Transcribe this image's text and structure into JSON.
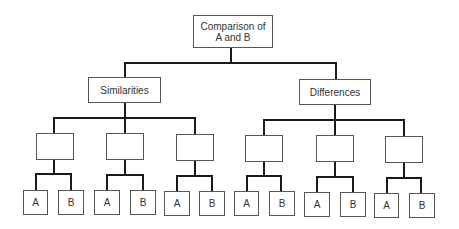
{
  "diagram": {
    "type": "tree",
    "line_color": "#1a1a1a",
    "box_border_color": "#555555",
    "root": {
      "label_line1": "Comparison of",
      "label_line2": "A and B"
    },
    "branches": [
      {
        "label": "Similarities",
        "children": [
          {
            "label": "",
            "leaves": [
              "A",
              "B"
            ]
          },
          {
            "label": "",
            "leaves": [
              "A",
              "B"
            ]
          },
          {
            "label": "",
            "leaves": [
              "A",
              "B"
            ]
          }
        ]
      },
      {
        "label": "Differences",
        "children": [
          {
            "label": "",
            "leaves": [
              "A",
              "B"
            ]
          },
          {
            "label": "",
            "leaves": [
              "A",
              "B"
            ]
          },
          {
            "label": "",
            "leaves": [
              "A",
              "B"
            ]
          }
        ]
      }
    ]
  }
}
